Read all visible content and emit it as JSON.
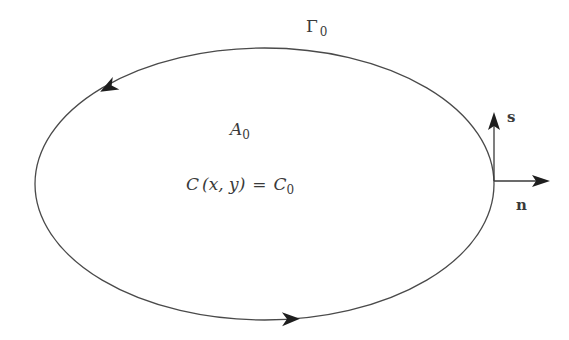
{
  "diagram": {
    "boundary_label": {
      "base": "Γ",
      "subscript": "0"
    },
    "area_label": {
      "base": "A",
      "subscript": "0"
    },
    "equation": {
      "lhs": "C",
      "args": "(x, y)",
      "equals": "=",
      "rhs_base": "C",
      "rhs_subscript": "0"
    },
    "tangent_vector_label": "s",
    "normal_vector_label": "n",
    "colors": {
      "stroke": "#3a3a3a",
      "background": "#ffffff"
    }
  }
}
